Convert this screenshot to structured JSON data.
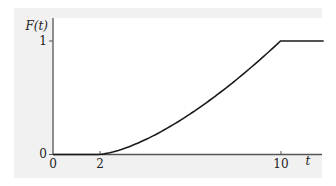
{
  "chart_data": {
    "type": "line",
    "title": "",
    "xlabel": "t",
    "ylabel": "F(t)",
    "x_ticks": [
      "0",
      "2",
      "10"
    ],
    "y_ticks": [
      "0",
      "1"
    ],
    "xlim": [
      0,
      12
    ],
    "ylim": [
      0,
      1.1
    ],
    "grid": false,
    "legend": null,
    "series": [
      {
        "name": "F(t)",
        "description": "0 for t<=2, rises convexly ((t-2)/8)^1.5 for 2<=t<=10, constant 1 for t>=10",
        "x": [
          0,
          2,
          3,
          4,
          5,
          6,
          7,
          8,
          9,
          10,
          11.9
        ],
        "y": [
          0,
          0,
          0.044,
          0.125,
          0.23,
          0.354,
          0.494,
          0.65,
          0.819,
          1,
          1
        ]
      }
    ]
  },
  "labels": {
    "ylabel": "F(t)",
    "xlabel": "t",
    "y_tick_0": "0",
    "y_tick_1": "1",
    "x_tick_0": "0",
    "x_tick_2": "2",
    "x_tick_10": "10"
  }
}
